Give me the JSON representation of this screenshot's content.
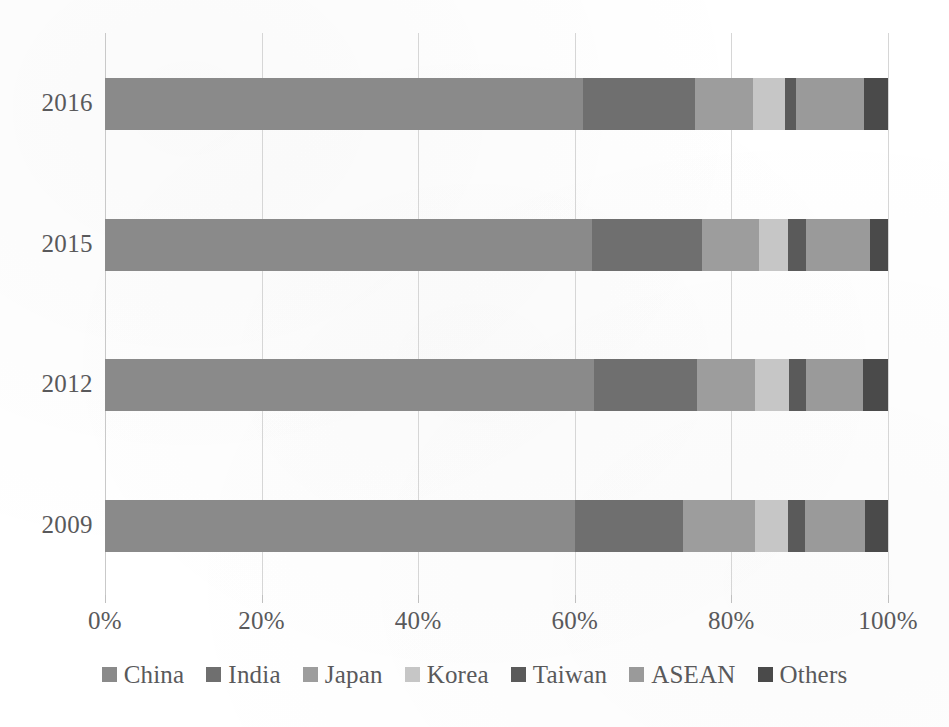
{
  "chart_data": {
    "type": "bar",
    "orientation": "horizontal",
    "stacked": true,
    "normalized": true,
    "title": "",
    "subtitle": "",
    "xlabel": "",
    "ylabel": "",
    "categories": [
      "2016",
      "2015",
      "2012",
      "2009"
    ],
    "x_tick_labels": [
      "0%",
      "20%",
      "40%",
      "60%",
      "80%",
      "100%"
    ],
    "x_tick_values": [
      0,
      20,
      40,
      60,
      80,
      100
    ],
    "xlim": [
      0,
      100
    ],
    "grid": true,
    "grid_axis": "x",
    "legend_position": "bottom",
    "legend": [
      "China",
      "India",
      "Japan",
      "Korea",
      "Taiwan",
      "ASEAN",
      "Others"
    ],
    "series": [
      {
        "name": "China",
        "color": "#8a8a8a",
        "values": [
          61.0,
          62.2,
          62.5,
          60.0
        ]
      },
      {
        "name": "India",
        "color": "#6f6f6f",
        "values": [
          14.3,
          14.0,
          13.2,
          13.8
        ]
      },
      {
        "name": "Japan",
        "color": "#9d9d9d",
        "values": [
          7.4,
          7.3,
          7.4,
          9.2
        ]
      },
      {
        "name": "Korea",
        "color": "#c6c6c6",
        "values": [
          4.1,
          3.7,
          4.3,
          4.2
        ]
      },
      {
        "name": "Taiwan",
        "color": "#5a5a5a",
        "values": [
          1.4,
          2.3,
          2.2,
          2.2
        ]
      },
      {
        "name": "ASEAN",
        "color": "#9a9a9a",
        "values": [
          8.7,
          8.2,
          7.3,
          7.7
        ]
      },
      {
        "name": "Others",
        "color": "#4a4a4a",
        "values": [
          3.1,
          2.3,
          3.2,
          2.9
        ]
      }
    ]
  },
  "axis": {
    "tick_0": "0%",
    "tick_1": "20%",
    "tick_2": "40%",
    "tick_3": "60%",
    "tick_4": "80%",
    "tick_5": "100%"
  },
  "categories": {
    "row_0": "2016",
    "row_1": "2015",
    "row_2": "2012",
    "row_3": "2009"
  },
  "legend": {
    "item_0": "China",
    "item_1": "India",
    "item_2": "Japan",
    "item_3": "Korea",
    "item_4": "Taiwan",
    "item_5": "ASEAN",
    "item_6": "Others"
  },
  "colors": {
    "china": "#8a8a8a",
    "india": "#6f6f6f",
    "japan": "#9d9d9d",
    "korea": "#c6c6c6",
    "taiwan": "#5a5a5a",
    "asean": "#9a9a9a",
    "others": "#4a4a4a",
    "gridline": "#d6d6d6",
    "text": "#59595b",
    "background": "#ffffff"
  }
}
